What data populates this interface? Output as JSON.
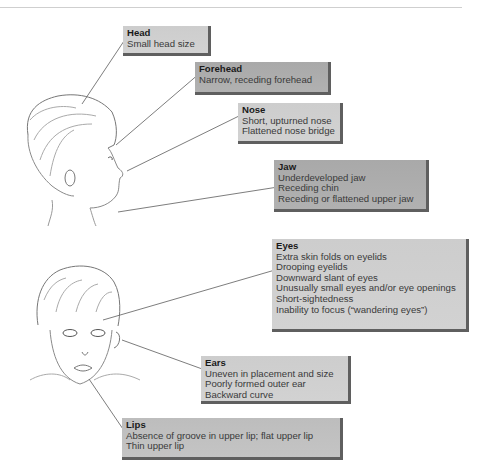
{
  "figure": {
    "labels": [
      {
        "id": "head",
        "title": "Head",
        "lines": [
          "Small head size"
        ]
      },
      {
        "id": "forehead",
        "title": "Forehead",
        "lines": [
          "Narrow, receding forehead"
        ]
      },
      {
        "id": "nose",
        "title": "Nose",
        "lines": [
          "Short, upturned nose",
          "Flattened nose bridge"
        ]
      },
      {
        "id": "jaw",
        "title": "Jaw",
        "lines": [
          "Underdeveloped jaw",
          "Receding chin",
          "Receding or flattened upper jaw"
        ]
      },
      {
        "id": "eyes",
        "title": "Eyes",
        "lines": [
          "Extra skin folds on eyelids",
          "Drooping eyelids",
          "Downward slant of eyes",
          "Unusually small eyes and/or eye openings",
          "Short-sightedness",
          "Inability to focus (“wandering eyes”)"
        ]
      },
      {
        "id": "ears",
        "title": "Ears",
        "lines": [
          "Uneven in placement and size",
          "Poorly formed outer ear",
          "Backward curve"
        ]
      },
      {
        "id": "lips",
        "title": "Lips",
        "lines": [
          "Absence of groove in upper lip; flat upper lip",
          "Thin upper lip"
        ]
      }
    ],
    "illustrations": [
      "child-profile-sketch",
      "child-frontal-sketch"
    ],
    "colors": {
      "box_fill": "#c0c0c0",
      "box_shadow": "#5f5f5f",
      "leader_line": "#6e6e6e"
    }
  }
}
